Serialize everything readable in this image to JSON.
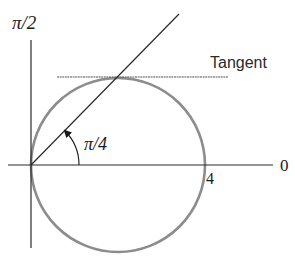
{
  "diagram": {
    "type": "polar-graph",
    "labels": {
      "vertical_axis": "π/2",
      "horizontal_axis": "0",
      "angle": "π/4",
      "radius_value": "4",
      "tangent": "Tangent"
    },
    "colors": {
      "circle": "#8c8c8c",
      "axes": "#2a2a2a",
      "tangent_line": "#555555",
      "text": "#1a1a1a"
    }
  }
}
